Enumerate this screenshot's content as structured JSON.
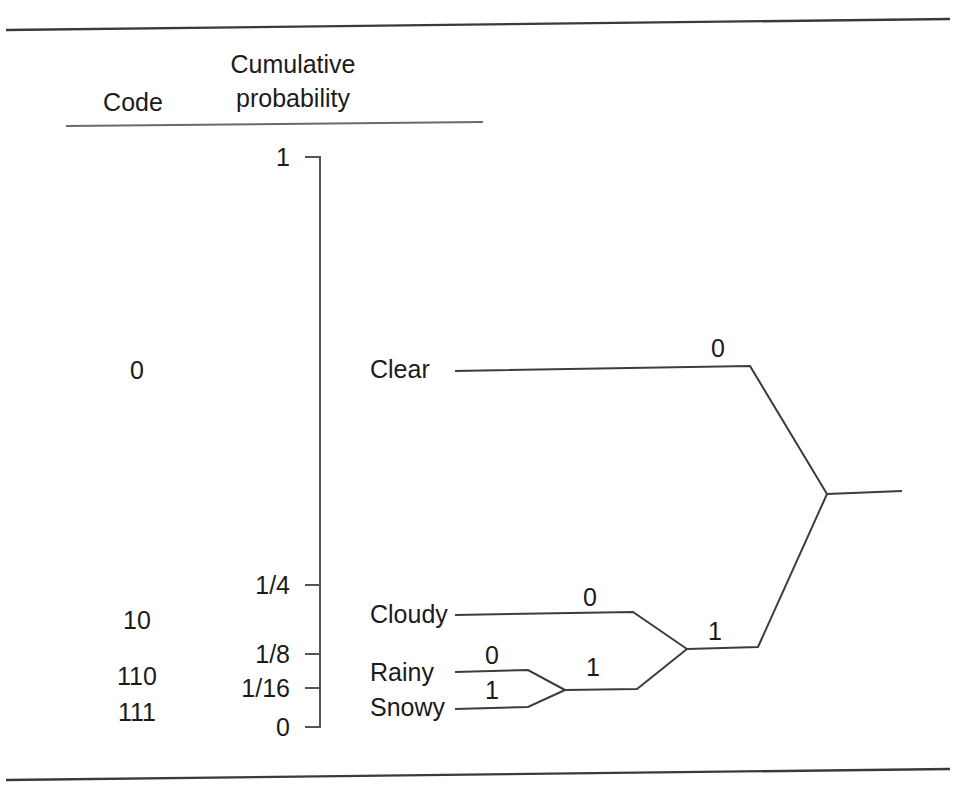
{
  "figure": {
    "headers": {
      "code": "Code",
      "cumulative_line1": "Cumulative",
      "cumulative_line2": "probability"
    },
    "codes": [
      {
        "label": "0",
        "x": 137,
        "y": 370
      },
      {
        "label": "10",
        "x": 137,
        "y": 620
      },
      {
        "label": "110",
        "x": 137,
        "y": 676
      },
      {
        "label": "111",
        "x": 137,
        "y": 712
      }
    ],
    "axis": {
      "ticks": [
        {
          "label": "1",
          "y": 157
        },
        {
          "label": "1/4",
          "y": 585
        },
        {
          "label": "1/8",
          "y": 654
        },
        {
          "label": "1/16",
          "y": 688
        },
        {
          "label": "0",
          "y": 727
        }
      ],
      "top_value": "1",
      "bottom_value": "0"
    },
    "states": [
      {
        "name": "Clear",
        "x": 370,
        "y": 370
      },
      {
        "name": "Cloudy",
        "x": 370,
        "y": 615
      },
      {
        "name": "Rainy",
        "x": 370,
        "y": 673
      },
      {
        "name": "Snowy",
        "x": 370,
        "y": 708
      }
    ],
    "branch_bits": [
      {
        "label": "0",
        "x": 718,
        "y": 349,
        "for": "clear-branch"
      },
      {
        "label": "0",
        "x": 590,
        "y": 598,
        "for": "cloudy-branch"
      },
      {
        "label": "1",
        "x": 715,
        "y": 632,
        "for": "precipitation-branch"
      },
      {
        "label": "0",
        "x": 492,
        "y": 656,
        "for": "rainy-branch"
      },
      {
        "label": "1",
        "x": 492,
        "y": 691,
        "for": "snowy-branch"
      },
      {
        "label": "1",
        "x": 593,
        "y": 668,
        "for": "rain-snow-branch"
      }
    ],
    "colors": {
      "ink": "#1b1b1b",
      "rule": "#3a3a3a",
      "background": "#ffffff"
    }
  }
}
